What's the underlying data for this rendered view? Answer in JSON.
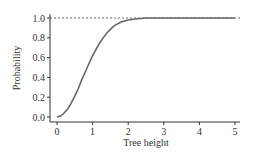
{
  "chart_data": {
    "type": "line",
    "title": "",
    "xlabel": "Tree height",
    "ylabel": "Probability",
    "xlim": [
      0,
      5
    ],
    "ylim": [
      0,
      1
    ],
    "x_ticks": [
      "0",
      "1",
      "2",
      "3",
      "4",
      "5"
    ],
    "y_ticks": [
      "0.0",
      "0.2",
      "0.4",
      "0.6",
      "0.8",
      "1.0"
    ],
    "grid": false,
    "reference_line": {
      "y": 1.0,
      "style": "dashed"
    },
    "series": [
      {
        "name": "probability",
        "x": [
          0,
          0.1,
          0.2,
          0.3,
          0.4,
          0.5,
          0.6,
          0.7,
          0.8,
          0.9,
          1.0,
          1.2,
          1.4,
          1.6,
          1.8,
          2.0,
          2.2,
          2.5,
          3.0,
          3.5,
          4.0,
          4.5,
          5.0
        ],
        "values": [
          0.0,
          0.01,
          0.04,
          0.08,
          0.14,
          0.21,
          0.29,
          0.38,
          0.46,
          0.54,
          0.62,
          0.75,
          0.85,
          0.92,
          0.96,
          0.98,
          0.99,
          1.0,
          1.0,
          1.0,
          1.0,
          1.0,
          1.0
        ]
      }
    ]
  }
}
